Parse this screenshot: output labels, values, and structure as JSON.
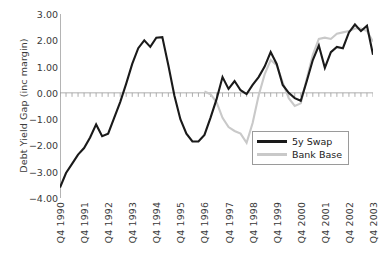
{
  "chart_data": {
    "type": "line",
    "title": "",
    "xlabel": "",
    "ylabel": "Debt Yield Gap (inc margin)",
    "ylim": [
      -4.0,
      3.0
    ],
    "yticks": [
      "3.00",
      "2.00",
      "1.00",
      "0.00",
      "-1.00",
      "-2.00",
      "-3.00",
      "-4.00"
    ],
    "ytick_values": [
      3.0,
      2.0,
      1.0,
      0.0,
      -1.0,
      -2.0,
      -3.0,
      -4.0
    ],
    "grid": false,
    "zero_line": true,
    "legend_position": "bottom-right",
    "xtick_labels": [
      "Q4 1990",
      "Q4 1991",
      "Q4 1992",
      "Q4 1993",
      "Q4 1994",
      "Q4 1995",
      "Q4 1996",
      "Q4 1997",
      "Q4 1998",
      "Q4 1999",
      "Q4 2000",
      "Q4 2001",
      "Q4 2002",
      "Q4 2003"
    ],
    "x": [
      "Q4 1990",
      "Q1 1991",
      "Q2 1991",
      "Q3 1991",
      "Q4 1991",
      "Q1 1992",
      "Q2 1992",
      "Q3 1992",
      "Q4 1992",
      "Q1 1993",
      "Q2 1993",
      "Q3 1993",
      "Q4 1993",
      "Q1 1994",
      "Q2 1994",
      "Q3 1994",
      "Q4 1994",
      "Q1 1995",
      "Q2 1995",
      "Q3 1995",
      "Q4 1995",
      "Q1 1996",
      "Q2 1996",
      "Q3 1996",
      "Q4 1996",
      "Q1 1997",
      "Q2 1997",
      "Q3 1997",
      "Q4 1997",
      "Q1 1998",
      "Q2 1998",
      "Q3 1998",
      "Q4 1998",
      "Q1 1999",
      "Q2 1999",
      "Q3 1999",
      "Q4 1999",
      "Q1 2000",
      "Q2 2000",
      "Q3 2000",
      "Q4 2000",
      "Q1 2001",
      "Q2 2001",
      "Q3 2001",
      "Q4 2001",
      "Q1 2002",
      "Q2 2002",
      "Q3 2002",
      "Q4 2002",
      "Q1 2003",
      "Q2 2003",
      "Q3 2003",
      "Q4 2003"
    ],
    "series": [
      {
        "name": "5y Swap",
        "color": "#1a1a1a",
        "width": 2.1,
        "values": [
          -3.6,
          -3.05,
          -2.7,
          -2.35,
          -2.1,
          -1.7,
          -1.2,
          -1.65,
          -1.55,
          -0.95,
          -0.35,
          0.35,
          1.1,
          1.7,
          2.0,
          1.75,
          2.1,
          2.12,
          1.05,
          -0.1,
          -1.0,
          -1.55,
          -1.85,
          -1.85,
          -1.6,
          -0.95,
          -0.25,
          0.6,
          0.15,
          0.45,
          0.1,
          -0.05,
          0.3,
          0.6,
          1.0,
          1.55,
          1.1,
          0.3,
          0.0,
          -0.2,
          -0.3,
          0.45,
          1.25,
          1.8,
          0.95,
          1.55,
          1.75,
          1.7,
          2.3,
          2.6,
          2.35,
          2.55,
          1.45
        ]
      },
      {
        "name": "Bank Base",
        "color": "#c9c9c9",
        "width": 2.1,
        "values": [
          null,
          null,
          null,
          null,
          null,
          null,
          null,
          null,
          null,
          null,
          null,
          null,
          null,
          null,
          null,
          null,
          null,
          null,
          null,
          null,
          null,
          null,
          null,
          null,
          0.05,
          -0.05,
          -0.35,
          -0.95,
          -1.3,
          -1.45,
          -1.55,
          -1.9,
          -1.15,
          -0.1,
          0.7,
          1.25,
          1.05,
          0.4,
          -0.2,
          -0.5,
          -0.4,
          0.55,
          1.45,
          2.05,
          2.1,
          2.05,
          2.25,
          2.3,
          2.35,
          2.45,
          2.45,
          2.35,
          1.95
        ]
      }
    ]
  },
  "legend": {
    "items": [
      {
        "label": "5y Swap",
        "color": "#1a1a1a"
      },
      {
        "label": "Bank Base",
        "color": "#c9c9c9"
      }
    ]
  }
}
